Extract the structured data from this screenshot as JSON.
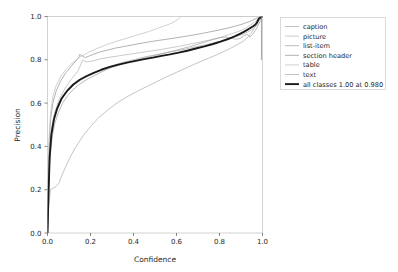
{
  "chart_data": {
    "type": "line",
    "title": "",
    "xlabel": "Confidence",
    "ylabel": "Precision",
    "xlim": [
      0.0,
      1.0
    ],
    "ylim": [
      0.0,
      1.0
    ],
    "xticks": [
      "0.0",
      "0.2",
      "0.4",
      "0.6",
      "0.8",
      "1.0"
    ],
    "yticks": [
      "0.0",
      "0.2",
      "0.4",
      "0.6",
      "0.8",
      "1.0"
    ],
    "xtick_values": [
      0.0,
      0.2,
      0.4,
      0.6,
      0.8,
      1.0
    ],
    "ytick_values": [
      0.0,
      0.2,
      0.4,
      0.6,
      0.8,
      1.0
    ],
    "grid": false,
    "legend_position": "outside right upper",
    "series": [
      {
        "name": "caption",
        "color": "#b0b0b0",
        "width": 0.8,
        "x": [
          0.0,
          0.004,
          0.01,
          0.018,
          0.03,
          0.05,
          0.075,
          0.1,
          0.13,
          0.16,
          0.19,
          0.22,
          0.26,
          0.3,
          0.34,
          0.38,
          0.42,
          0.46,
          0.5,
          0.54,
          0.58,
          0.62,
          0.66,
          0.7,
          0.74,
          0.78,
          0.82,
          0.86,
          0.9,
          0.93,
          0.95,
          0.965,
          0.975,
          0.98,
          0.985,
          0.99,
          0.995,
          1.0
        ],
        "y": [
          0.0,
          0.18,
          0.36,
          0.47,
          0.54,
          0.6,
          0.64,
          0.665,
          0.69,
          0.71,
          0.725,
          0.74,
          0.758,
          0.772,
          0.785,
          0.795,
          0.805,
          0.815,
          0.822,
          0.83,
          0.838,
          0.845,
          0.853,
          0.862,
          0.87,
          0.88,
          0.89,
          0.902,
          0.915,
          0.928,
          0.94,
          0.95,
          0.962,
          0.972,
          0.982,
          0.99,
          0.996,
          1.0
        ]
      },
      {
        "name": "picture",
        "color": "#bdbdbd",
        "width": 0.8,
        "x": [
          0.0,
          0.005,
          0.012,
          0.022,
          0.035,
          0.055,
          0.08,
          0.11,
          0.14,
          0.16,
          0.165,
          0.18,
          0.21,
          0.25,
          0.29,
          0.33,
          0.37,
          0.41,
          0.45,
          0.49,
          0.53,
          0.57,
          0.61,
          0.65,
          0.69,
          0.73,
          0.77,
          0.81,
          0.85,
          0.88,
          0.905,
          0.925,
          0.94,
          0.955,
          0.968,
          0.978,
          0.986,
          0.993,
          1.0
        ],
        "y": [
          0.0,
          0.22,
          0.4,
          0.5,
          0.56,
          0.62,
          0.665,
          0.71,
          0.745,
          0.79,
          0.8,
          0.79,
          0.795,
          0.805,
          0.812,
          0.818,
          0.824,
          0.83,
          0.836,
          0.842,
          0.848,
          0.855,
          0.862,
          0.87,
          0.878,
          0.886,
          0.895,
          0.905,
          0.918,
          0.928,
          0.938,
          0.948,
          0.958,
          0.968,
          0.978,
          0.986,
          0.992,
          0.997,
          1.0
        ]
      },
      {
        "name": "list-item",
        "color": "#a8a8a8",
        "width": 0.8,
        "x": [
          0.0,
          0.004,
          0.01,
          0.02,
          0.032,
          0.05,
          0.07,
          0.095,
          0.12,
          0.15,
          0.185,
          0.22,
          0.26,
          0.3,
          0.34,
          0.38,
          0.42,
          0.46,
          0.5,
          0.54,
          0.58,
          0.62,
          0.66,
          0.7,
          0.74,
          0.775,
          0.805,
          0.83,
          0.855,
          0.875,
          0.895,
          0.912,
          0.928,
          0.942,
          0.955,
          0.966,
          0.976,
          0.985,
          0.992,
          1.0
        ],
        "y": [
          0.0,
          0.15,
          0.33,
          0.43,
          0.5,
          0.555,
          0.6,
          0.636,
          0.663,
          0.688,
          0.71,
          0.728,
          0.748,
          0.765,
          0.778,
          0.79,
          0.8,
          0.81,
          0.82,
          0.83,
          0.84,
          0.85,
          0.86,
          0.872,
          0.885,
          0.895,
          0.903,
          0.905,
          0.9,
          0.895,
          0.898,
          0.91,
          0.918,
          0.905,
          0.918,
          0.935,
          0.952,
          0.97,
          0.986,
          1.0
        ]
      },
      {
        "name": "section header",
        "color": "#9e9e9e",
        "width": 0.8,
        "x": [
          0.0,
          0.003,
          0.008,
          0.015,
          0.025,
          0.04,
          0.06,
          0.085,
          0.115,
          0.145,
          0.15,
          0.175,
          0.205,
          0.24,
          0.28,
          0.32,
          0.36,
          0.4,
          0.44,
          0.48,
          0.52,
          0.56,
          0.6,
          0.64,
          0.68,
          0.72,
          0.76,
          0.8,
          0.84,
          0.875,
          0.9,
          0.92,
          0.938,
          0.952,
          0.964,
          0.974,
          0.983,
          0.991,
          1.0
        ],
        "y": [
          0.0,
          0.2,
          0.42,
          0.53,
          0.6,
          0.655,
          0.7,
          0.74,
          0.775,
          0.81,
          0.825,
          0.81,
          0.822,
          0.835,
          0.845,
          0.855,
          0.862,
          0.87,
          0.877,
          0.884,
          0.89,
          0.896,
          0.902,
          0.908,
          0.915,
          0.922,
          0.93,
          0.938,
          0.947,
          0.956,
          0.963,
          0.97,
          0.976,
          0.982,
          0.988,
          0.992,
          0.996,
          0.998,
          1.0
        ]
      },
      {
        "name": "table",
        "color": "#c4c4c4",
        "width": 0.8,
        "x": [
          0.0,
          0.003,
          0.008,
          0.015,
          0.025,
          0.04,
          0.06,
          0.085,
          0.115,
          0.15,
          0.19,
          0.23,
          0.275,
          0.32,
          0.37,
          0.42,
          0.47,
          0.52,
          0.56,
          0.59,
          0.61,
          0.618,
          0.622,
          1.0
        ],
        "y": [
          0.0,
          0.24,
          0.455,
          0.56,
          0.63,
          0.68,
          0.72,
          0.755,
          0.785,
          0.812,
          0.834,
          0.852,
          0.87,
          0.885,
          0.9,
          0.915,
          0.93,
          0.948,
          0.962,
          0.975,
          0.99,
          0.998,
          1.0,
          1.0
        ]
      },
      {
        "name": "text",
        "color": "#b5b5b5",
        "width": 0.8,
        "x": [
          0.0,
          0.005,
          0.014,
          0.025,
          0.04,
          0.055,
          0.06,
          0.075,
          0.1,
          0.13,
          0.165,
          0.2,
          0.24,
          0.285,
          0.33,
          0.375,
          0.42,
          0.465,
          0.51,
          0.555,
          0.6,
          0.64,
          0.68,
          0.715,
          0.75,
          0.785,
          0.815,
          0.845,
          0.87,
          0.89,
          0.908,
          0.922,
          0.935,
          0.946,
          0.956,
          0.965,
          0.974,
          0.982,
          0.99,
          1.0
        ],
        "y": [
          0.0,
          0.12,
          0.2,
          0.206,
          0.215,
          0.232,
          0.25,
          0.285,
          0.34,
          0.395,
          0.448,
          0.492,
          0.535,
          0.572,
          0.605,
          0.632,
          0.656,
          0.678,
          0.7,
          0.722,
          0.742,
          0.76,
          0.778,
          0.793,
          0.808,
          0.822,
          0.836,
          0.85,
          0.863,
          0.874,
          0.884,
          0.895,
          0.908,
          0.922,
          0.938,
          0.953,
          0.968,
          0.98,
          0.992,
          1.0
        ]
      },
      {
        "name": "all classes 1.00 at 0.980",
        "color": "#1a1a1a",
        "width": 1.9,
        "x": [
          0.0,
          0.004,
          0.01,
          0.018,
          0.03,
          0.045,
          0.065,
          0.09,
          0.12,
          0.15,
          0.18,
          0.215,
          0.25,
          0.29,
          0.33,
          0.37,
          0.41,
          0.45,
          0.49,
          0.53,
          0.57,
          0.61,
          0.65,
          0.69,
          0.73,
          0.77,
          0.805,
          0.84,
          0.87,
          0.895,
          0.915,
          0.932,
          0.945,
          0.956,
          0.966,
          0.974,
          0.98,
          0.986,
          0.992,
          1.0
        ],
        "y": [
          0.0,
          0.16,
          0.35,
          0.455,
          0.525,
          0.575,
          0.62,
          0.655,
          0.686,
          0.708,
          0.724,
          0.74,
          0.754,
          0.767,
          0.778,
          0.787,
          0.795,
          0.803,
          0.81,
          0.818,
          0.825,
          0.833,
          0.842,
          0.852,
          0.862,
          0.873,
          0.884,
          0.896,
          0.908,
          0.92,
          0.93,
          0.94,
          0.948,
          0.955,
          0.962,
          0.972,
          0.985,
          0.992,
          0.997,
          1.0
        ]
      }
    ]
  },
  "axes": {
    "xlabel": "Confidence",
    "ylabel": "Precision"
  },
  "legend": {
    "items": [
      {
        "label": "caption"
      },
      {
        "label": "picture"
      },
      {
        "label": "list-item"
      },
      {
        "label": "section header"
      },
      {
        "label": "table"
      },
      {
        "label": "text"
      },
      {
        "label": "all classes 1.00 at 0.980"
      }
    ]
  }
}
